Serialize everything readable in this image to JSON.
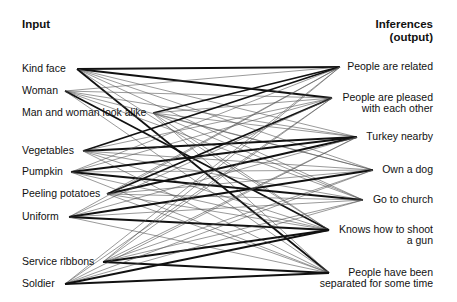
{
  "headers": {
    "input": "Input",
    "output_line1": "Inferences",
    "output_line2": "(output)"
  },
  "inputs": [
    {
      "id": "kind_face",
      "label": "Kind face",
      "x": 74,
      "y": 69,
      "label_top": 63
    },
    {
      "id": "woman",
      "label": "Woman",
      "x": 62,
      "y": 91,
      "label_top": 85
    },
    {
      "id": "look_alike",
      "label": "Man and woman look alike",
      "x": 150,
      "y": 113,
      "label_top": 107
    },
    {
      "id": "vegetables",
      "label": "Vegetables",
      "x": 80,
      "y": 151,
      "label_top": 145
    },
    {
      "id": "pumpkin",
      "label": "Pumpkin",
      "x": 68,
      "y": 172,
      "label_top": 166
    },
    {
      "id": "peeling",
      "label": "Peeling potatoes",
      "x": 104,
      "y": 194,
      "label_top": 188
    },
    {
      "id": "uniform",
      "label": "Uniform",
      "x": 66,
      "y": 217,
      "label_top": 211
    },
    {
      "id": "ribbons",
      "label": "Service ribbons",
      "x": 100,
      "y": 262,
      "label_top": 256
    },
    {
      "id": "soldier",
      "label": "Soldier",
      "x": 62,
      "y": 284,
      "label_top": 278
    }
  ],
  "outputs": [
    {
      "id": "related",
      "lines": [
        "People are related"
      ],
      "x": 343,
      "y": 67,
      "label_top": 61
    },
    {
      "id": "pleased",
      "lines": [
        "People are pleased",
        "with each other"
      ],
      "x": 335,
      "y": 98,
      "label_top": 92
    },
    {
      "id": "turkey",
      "lines": [
        "Turkey nearby"
      ],
      "x": 360,
      "y": 137,
      "label_top": 131
    },
    {
      "id": "dog",
      "lines": [
        "Own a dog"
      ],
      "x": 376,
      "y": 170,
      "label_top": 164
    },
    {
      "id": "church",
      "lines": [
        "Go to church"
      ],
      "x": 366,
      "y": 200,
      "label_top": 194
    },
    {
      "id": "shoot",
      "lines": [
        "Knows how to shoot",
        "a gun"
      ],
      "x": 332,
      "y": 230,
      "label_top": 224
    },
    {
      "id": "separated",
      "lines": [
        "People have been",
        "separated for some time"
      ],
      "x": 332,
      "y": 273,
      "label_top": 267
    }
  ],
  "style": {
    "thick_color": "#111111",
    "thin_color": "#555555",
    "thick_width": 1.8,
    "thin_width": 0.6
  },
  "strong_links": [
    [
      "kind_face",
      "related"
    ],
    [
      "kind_face",
      "separated"
    ],
    [
      "kind_face",
      "pleased"
    ],
    [
      "look_alike",
      "related"
    ],
    [
      "woman",
      "shoot"
    ],
    [
      "vegetables",
      "turkey"
    ],
    [
      "vegetables",
      "related"
    ],
    [
      "pumpkin",
      "turkey"
    ],
    [
      "pumpkin",
      "church"
    ],
    [
      "peeling",
      "turkey"
    ],
    [
      "peeling",
      "pleased"
    ],
    [
      "uniform",
      "shoot"
    ],
    [
      "uniform",
      "dog"
    ],
    [
      "ribbons",
      "separated"
    ],
    [
      "ribbons",
      "shoot"
    ],
    [
      "soldier",
      "separated"
    ],
    [
      "soldier",
      "shoot"
    ]
  ]
}
